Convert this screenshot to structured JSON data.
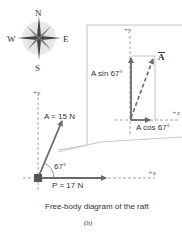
{
  "compass": {
    "n": "N",
    "s": "S",
    "e": "E",
    "w": "W"
  },
  "inset": {
    "y_axis": "+y",
    "x_axis": "+x",
    "vector": "A",
    "vertical_component": "A sin 67°",
    "horizontal_component": "A cos 67°"
  },
  "main": {
    "y_axis": "+y",
    "x_axis": "+x",
    "vector_a": "A = 15 N",
    "angle": "67°",
    "vector_p": "P = 17 N"
  },
  "caption": "Free-body diagram of the raft",
  "part_label": "(b)",
  "colors": {
    "vector": "#6b6b6b",
    "axis": "#8a8a8a",
    "text": "#333333",
    "callout": "#c8c8c8"
  }
}
